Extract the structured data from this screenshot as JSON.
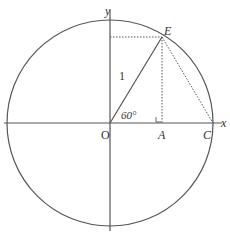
{
  "diagram": {
    "axes": {
      "x_label": "x",
      "y_label": "y"
    },
    "points": {
      "origin": "O",
      "E": "E",
      "A": "A",
      "C": "C"
    },
    "labels": {
      "radius": "1",
      "angle": "60°"
    },
    "colors": {
      "line": "#555555",
      "text": "#333333"
    }
  }
}
